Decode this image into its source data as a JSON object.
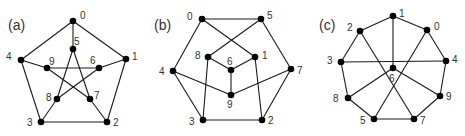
{
  "figure": {
    "panels": [
      {
        "label": "(a)",
        "label_pos": [
          8,
          30
        ],
        "nodes": [
          {
            "id": "0",
            "x": 73,
            "y": 21,
            "lx": 80,
            "ly": 19
          },
          {
            "id": "1",
            "x": 126,
            "y": 59,
            "lx": 132,
            "ly": 60
          },
          {
            "id": "2",
            "x": 107,
            "y": 122,
            "lx": 113,
            "ly": 126
          },
          {
            "id": "3",
            "x": 41,
            "y": 122,
            "lx": 27,
            "ly": 126
          },
          {
            "id": "4",
            "x": 21,
            "y": 60,
            "lx": 6,
            "ly": 60
          },
          {
            "id": "5",
            "x": 73,
            "y": 49,
            "lx": 74,
            "ly": 45
          },
          {
            "id": "6",
            "x": 99,
            "y": 68,
            "lx": 90,
            "ly": 64
          },
          {
            "id": "7",
            "x": 90,
            "y": 99,
            "lx": 94,
            "ly": 99
          },
          {
            "id": "8",
            "x": 57,
            "y": 99,
            "lx": 46,
            "ly": 101
          },
          {
            "id": "9",
            "x": 47,
            "y": 68,
            "lx": 49,
            "ly": 65
          }
        ],
        "edges": [
          [
            "0",
            "1"
          ],
          [
            "1",
            "2"
          ],
          [
            "2",
            "3"
          ],
          [
            "3",
            "4"
          ],
          [
            "4",
            "0"
          ],
          [
            "0",
            "5"
          ],
          [
            "1",
            "6"
          ],
          [
            "2",
            "7"
          ],
          [
            "3",
            "8"
          ],
          [
            "4",
            "9"
          ],
          [
            "5",
            "7"
          ],
          [
            "7",
            "9"
          ],
          [
            "9",
            "6"
          ],
          [
            "6",
            "8"
          ],
          [
            "8",
            "5"
          ]
        ]
      },
      {
        "label": "(b)",
        "label_pos": [
          154,
          30
        ],
        "nodes": [
          {
            "id": "0",
            "x": 202,
            "y": 19,
            "lx": 187,
            "ly": 20
          },
          {
            "id": "5",
            "x": 261,
            "y": 19,
            "lx": 267,
            "ly": 19
          },
          {
            "id": "8",
            "x": 208,
            "y": 57,
            "lx": 195,
            "ly": 59
          },
          {
            "id": "1",
            "x": 255,
            "y": 57,
            "lx": 262,
            "ly": 59
          },
          {
            "id": "6",
            "x": 231,
            "y": 70,
            "lx": 227,
            "ly": 65
          },
          {
            "id": "4",
            "x": 173,
            "y": 71,
            "lx": 159,
            "ly": 75
          },
          {
            "id": "7",
            "x": 291,
            "y": 69,
            "lx": 297,
            "ly": 74
          },
          {
            "id": "9",
            "x": 231,
            "y": 95,
            "lx": 227,
            "ly": 108
          },
          {
            "id": "3",
            "x": 203,
            "y": 120,
            "lx": 189,
            "ly": 125
          },
          {
            "id": "2",
            "x": 262,
            "y": 120,
            "lx": 268,
            "ly": 124
          }
        ],
        "edges": [
          [
            "0",
            "5"
          ],
          [
            "5",
            "7"
          ],
          [
            "7",
            "2"
          ],
          [
            "2",
            "3"
          ],
          [
            "3",
            "4"
          ],
          [
            "4",
            "0"
          ],
          [
            "0",
            "1"
          ],
          [
            "5",
            "8"
          ],
          [
            "8",
            "6"
          ],
          [
            "6",
            "1"
          ],
          [
            "6",
            "9"
          ],
          [
            "8",
            "3"
          ],
          [
            "1",
            "2"
          ],
          [
            "4",
            "9"
          ],
          [
            "9",
            "7"
          ]
        ]
      },
      {
        "label": "(c)",
        "label_pos": [
          319,
          30
        ],
        "nodes": [
          {
            "id": "1",
            "x": 393,
            "y": 16,
            "lx": 399,
            "ly": 17
          },
          {
            "id": "2",
            "x": 360,
            "y": 31,
            "lx": 347,
            "ly": 31
          },
          {
            "id": "0",
            "x": 427,
            "y": 30,
            "lx": 434,
            "ly": 30
          },
          {
            "id": "3",
            "x": 341,
            "y": 62,
            "lx": 327,
            "ly": 64
          },
          {
            "id": "4",
            "x": 446,
            "y": 61,
            "lx": 452,
            "ly": 63
          },
          {
            "id": "6",
            "x": 393,
            "y": 68,
            "lx": 389,
            "ly": 82
          },
          {
            "id": "8",
            "x": 348,
            "y": 98,
            "lx": 333,
            "ly": 102
          },
          {
            "id": "9",
            "x": 440,
            "y": 96,
            "lx": 446,
            "ly": 100
          },
          {
            "id": "5",
            "x": 374,
            "y": 119,
            "lx": 360,
            "ly": 124
          },
          {
            "id": "7",
            "x": 414,
            "y": 119,
            "lx": 420,
            "ly": 124
          }
        ],
        "edges": [
          [
            "1",
            "2"
          ],
          [
            "1",
            "0"
          ],
          [
            "2",
            "3"
          ],
          [
            "0",
            "4"
          ],
          [
            "3",
            "8"
          ],
          [
            "4",
            "9"
          ],
          [
            "8",
            "5"
          ],
          [
            "9",
            "7"
          ],
          [
            "5",
            "7"
          ],
          [
            "1",
            "6"
          ],
          [
            "3",
            "4"
          ],
          [
            "2",
            "7"
          ],
          [
            "0",
            "5"
          ],
          [
            "6",
            "8"
          ],
          [
            "6",
            "9"
          ]
        ]
      }
    ]
  }
}
